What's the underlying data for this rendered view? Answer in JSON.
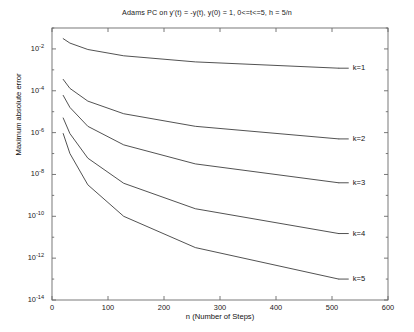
{
  "chart_data": {
    "type": "line",
    "title": "Adams PC on y'(t) = -y(t), y(0) = 1, 0<=t<=5, h = 5/n",
    "xlabel": "n (Number of Steps)",
    "ylabel": "Maximum absolute error",
    "xlim": [
      0,
      600
    ],
    "ylim_exponents": [
      -14,
      -1
    ],
    "yscale": "log",
    "grid": false,
    "legend_position": "inline-right",
    "xticks": [
      0,
      100,
      200,
      300,
      400,
      500,
      600
    ],
    "xtick_labels": [
      "0",
      "100",
      "200",
      "300",
      "400",
      "500",
      "600"
    ],
    "ytick_exponents": [
      -2,
      -4,
      -6,
      -8,
      -10,
      -12,
      -14
    ],
    "ytick_labels": [
      "10-2",
      "10-4",
      "10-6",
      "10-8",
      "10-10",
      "10-12",
      "10-14"
    ],
    "x": [
      20,
      32,
      64,
      128,
      256,
      512
    ],
    "series": [
      {
        "name": "k=1",
        "label": "k=1",
        "label_x": 600,
        "values": [
          0.031,
          0.019,
          0.0094,
          0.0047,
          0.0024,
          0.0012
        ]
      },
      {
        "name": "k=2",
        "label": "k=2",
        "label_x": 600,
        "values": [
          0.00035,
          0.00013,
          3.2e-05,
          8e-06,
          2e-06,
          5e-07
        ]
      },
      {
        "name": "k=3",
        "label": "k=3",
        "label_x": 600,
        "values": [
          6e-05,
          1.6e-05,
          2e-06,
          2.6e-07,
          3.2e-08,
          4e-09
        ]
      },
      {
        "name": "k=4",
        "label": "k=4",
        "label_x": 600,
        "values": [
          5e-06,
          9e-07,
          6e-08,
          3.8e-09,
          2.3e-10,
          1.5e-11
        ]
      },
      {
        "name": "k=5",
        "label": "k=5",
        "label_x": 600,
        "values": [
          9e-07,
          1e-07,
          3.2e-09,
          1e-10,
          3.2e-12,
          1e-13
        ]
      }
    ]
  },
  "axes": {
    "line_color": "#555555",
    "series_color": "#333333"
  }
}
